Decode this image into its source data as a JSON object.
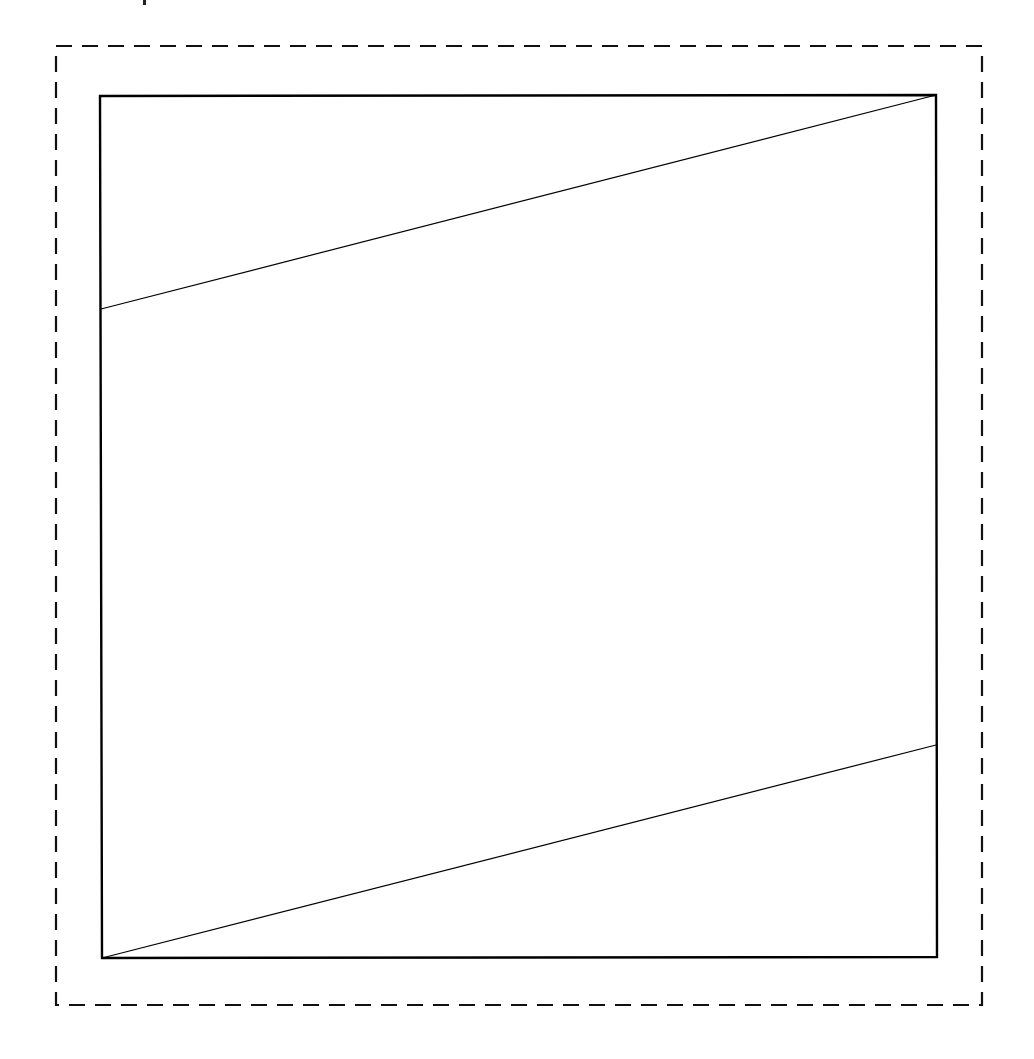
{
  "canvas": {
    "width": 1034,
    "height": 1059,
    "background": "#ffffff"
  },
  "colors": {
    "stroke": "#000000",
    "dashed_stroke": "#111111",
    "fragment": "#222222"
  },
  "top_fragment": {
    "x": 143,
    "y": 0,
    "width": 3,
    "height": 5
  },
  "outer_dashed_frame": {
    "x": 56,
    "y": 46,
    "width": 926,
    "height": 959,
    "stroke_width": 2.2,
    "dash": "16 10"
  },
  "square": {
    "x1": 100,
    "y1": 96,
    "x2": 936,
    "y2": 957,
    "stroke_width": 2.4,
    "corners": {
      "top_left": [
        100,
        96
      ],
      "top_right": [
        936,
        95
      ],
      "bottom_right": [
        937,
        957
      ],
      "bottom_left": [
        102,
        958
      ]
    }
  },
  "diagonals": [
    {
      "name": "upper-diagonal",
      "from": [
        101,
        309
      ],
      "to": [
        936,
        95
      ],
      "stroke_width": 1.2
    },
    {
      "name": "lower-diagonal",
      "from": [
        102,
        958
      ],
      "to": [
        936,
        745
      ],
      "stroke_width": 1.2
    }
  ]
}
